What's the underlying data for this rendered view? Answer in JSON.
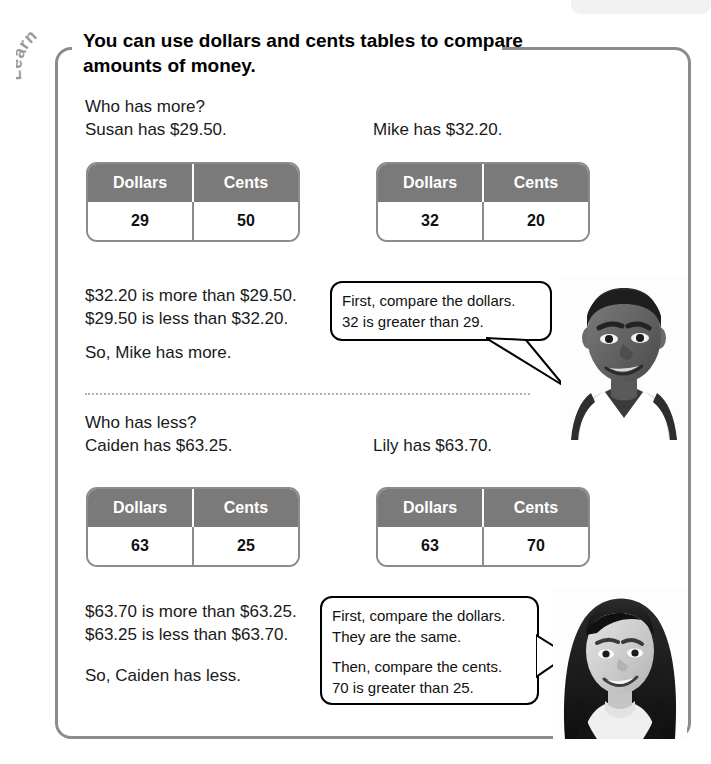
{
  "page": {
    "section_label": "Learn",
    "heading": "You can use dollars and cents tables to compare amounts of money."
  },
  "example1": {
    "question": "Who has more?",
    "left_statement": "Susan has $29.50.",
    "right_statement": "Mike has $32.20.",
    "table_left": {
      "headers": [
        "Dollars",
        "Cents"
      ],
      "values": [
        "29",
        "50"
      ]
    },
    "table_right": {
      "headers": [
        "Dollars",
        "Cents"
      ],
      "values": [
        "32",
        "20"
      ]
    },
    "comparison_line1": "$32.20 is more than $29.50.",
    "comparison_line2": "$29.50 is less than $32.20.",
    "conclusion": "So, Mike has more.",
    "bubble": {
      "line1": "First, compare the dollars.",
      "line2": "32 is greater than 29."
    },
    "photo_alt": "boy"
  },
  "example2": {
    "question": "Who has less?",
    "left_statement": "Caiden has $63.25.",
    "right_statement": "Lily has $63.70.",
    "table_left": {
      "headers": [
        "Dollars",
        "Cents"
      ],
      "values": [
        "63",
        "25"
      ]
    },
    "table_right": {
      "headers": [
        "Dollars",
        "Cents"
      ],
      "values": [
        "63",
        "70"
      ]
    },
    "comparison_line1": "$63.70 is more than $63.25.",
    "comparison_line2": "$63.25 is less than $63.70.",
    "conclusion": "So, Caiden has less.",
    "bubble": {
      "para1_line1": "First, compare the dollars.",
      "para1_line2": "They are the same.",
      "para2_line1": "Then, compare the cents.",
      "para2_line2": "70 is greater than 25."
    },
    "photo_alt": "girl"
  },
  "colors": {
    "table_header_bg": "#7a7a7a",
    "panel_border": "#8c8c8c",
    "label_gray": "#9a9a9a",
    "divider": "#b3b3b3"
  }
}
